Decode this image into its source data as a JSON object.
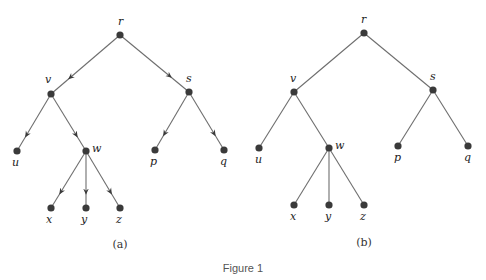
{
  "figure": {
    "caption": "Figure 1",
    "panels": [
      {
        "id": "a",
        "label": "(a)",
        "directed": true,
        "nodes": [
          {
            "id": "r",
            "x": 120,
            "y": 35,
            "label": "r",
            "lx": 118,
            "ly": 25
          },
          {
            "id": "v",
            "x": 51,
            "y": 94,
            "label": "v",
            "lx": 45,
            "ly": 83
          },
          {
            "id": "s",
            "x": 189,
            "y": 92,
            "label": "s",
            "lx": 186,
            "ly": 82
          },
          {
            "id": "u",
            "x": 17,
            "y": 151,
            "label": "u",
            "lx": 12,
            "ly": 166
          },
          {
            "id": "w",
            "x": 86,
            "y": 151,
            "label": "w",
            "lx": 92,
            "ly": 152
          },
          {
            "id": "p",
            "x": 155,
            "y": 150,
            "label": "p",
            "lx": 150,
            "ly": 165
          },
          {
            "id": "q",
            "x": 224,
            "y": 150,
            "label": "q",
            "lx": 220,
            "ly": 165
          },
          {
            "id": "x",
            "x": 51,
            "y": 208,
            "label": "x",
            "lx": 46,
            "ly": 223
          },
          {
            "id": "y",
            "x": 86,
            "y": 208,
            "label": "y",
            "lx": 81,
            "ly": 223
          },
          {
            "id": "z",
            "x": 120,
            "y": 208,
            "label": "z",
            "lx": 116,
            "ly": 223
          }
        ],
        "edges": [
          [
            "r",
            "v"
          ],
          [
            "r",
            "s"
          ],
          [
            "v",
            "u"
          ],
          [
            "v",
            "w"
          ],
          [
            "s",
            "p"
          ],
          [
            "s",
            "q"
          ],
          [
            "w",
            "x"
          ],
          [
            "w",
            "y"
          ],
          [
            "w",
            "z"
          ]
        ],
        "label_pos": {
          "x": 120,
          "y": 248
        }
      },
      {
        "id": "b",
        "label": "(b)",
        "directed": false,
        "nodes": [
          {
            "id": "r",
            "x": 364,
            "y": 33,
            "label": "r",
            "lx": 361,
            "ly": 23
          },
          {
            "id": "v",
            "x": 294,
            "y": 92,
            "label": "v",
            "lx": 290,
            "ly": 82
          },
          {
            "id": "s",
            "x": 433,
            "y": 90,
            "label": "s",
            "lx": 430,
            "ly": 80
          },
          {
            "id": "u",
            "x": 259,
            "y": 148,
            "label": "u",
            "lx": 255,
            "ly": 163
          },
          {
            "id": "w",
            "x": 329,
            "y": 148,
            "label": "w",
            "lx": 335,
            "ly": 149
          },
          {
            "id": "p",
            "x": 398,
            "y": 146,
            "label": "p",
            "lx": 394,
            "ly": 161
          },
          {
            "id": "q",
            "x": 468,
            "y": 146,
            "label": "q",
            "lx": 464,
            "ly": 161
          },
          {
            "id": "x",
            "x": 294,
            "y": 205,
            "label": "x",
            "lx": 290,
            "ly": 220
          },
          {
            "id": "y",
            "x": 329,
            "y": 205,
            "label": "y",
            "lx": 325,
            "ly": 220
          },
          {
            "id": "z",
            "x": 364,
            "y": 205,
            "label": "z",
            "lx": 360,
            "ly": 220
          }
        ],
        "edges": [
          [
            "r",
            "v"
          ],
          [
            "r",
            "s"
          ],
          [
            "v",
            "u"
          ],
          [
            "v",
            "w"
          ],
          [
            "s",
            "p"
          ],
          [
            "s",
            "q"
          ],
          [
            "w",
            "x"
          ],
          [
            "w",
            "y"
          ],
          [
            "w",
            "z"
          ]
        ],
        "label_pos": {
          "x": 364,
          "y": 246
        }
      }
    ]
  }
}
